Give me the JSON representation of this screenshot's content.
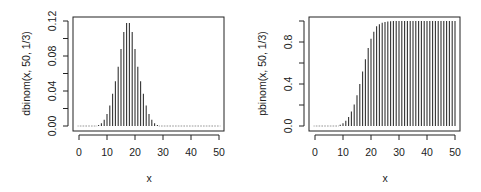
{
  "chart_data": [
    {
      "type": "bar",
      "style": "histogram-lines (type='h')",
      "title": "",
      "xlabel": "x",
      "ylabel": "dbinom(x, 50, 1/3)",
      "xlim": [
        0,
        50
      ],
      "ylim": [
        0,
        0.12
      ],
      "x_ticks": [
        "0",
        "10",
        "20",
        "30",
        "40",
        "50"
      ],
      "y_ticks": [
        "0.00",
        "0.04",
        "0.08",
        "0.12"
      ],
      "y_minor_ticks": [
        0.02,
        0.06,
        0.1
      ],
      "grid": false,
      "legend": null,
      "x": [
        0,
        1,
        2,
        3,
        4,
        5,
        6,
        7,
        8,
        9,
        10,
        11,
        12,
        13,
        14,
        15,
        16,
        17,
        18,
        19,
        20,
        21,
        22,
        23,
        24,
        25,
        26,
        27,
        28,
        29,
        30,
        31,
        32,
        33,
        34,
        35,
        36,
        37,
        38,
        39,
        40,
        41,
        42,
        43,
        44,
        45,
        46,
        47,
        48,
        49,
        50
      ],
      "values": [
        0.0,
        0.0,
        0.0,
        0.0,
        0.0,
        0.0001,
        0.0004,
        0.0011,
        0.0031,
        0.0071,
        0.0138,
        0.0233,
        0.0369,
        0.0512,
        0.0677,
        0.088,
        0.1074,
        0.1178,
        0.1178,
        0.1074,
        0.088,
        0.0677,
        0.0512,
        0.0369,
        0.0233,
        0.0138,
        0.0071,
        0.0031,
        0.0011,
        0.0004,
        0.0001,
        0.0,
        0.0,
        0.0,
        0.0,
        0.0,
        0.0,
        0.0,
        0.0,
        0.0,
        0.0,
        0.0,
        0.0,
        0.0,
        0.0,
        0.0,
        0.0,
        0.0,
        0.0,
        0.0,
        0.0
      ]
    },
    {
      "type": "bar",
      "style": "histogram-lines (type='h')",
      "title": "",
      "xlabel": "x",
      "ylabel": "pbinom(x, 50, 1/3)",
      "xlim": [
        0,
        50
      ],
      "ylim": [
        0,
        1
      ],
      "x_ticks": [
        "0",
        "10",
        "20",
        "30",
        "40",
        "50"
      ],
      "y_ticks": [
        "0.0",
        "0.4",
        "0.8"
      ],
      "y_minor_ticks": [
        0.2,
        0.6,
        1.0
      ],
      "grid": false,
      "legend": null,
      "x": [
        0,
        1,
        2,
        3,
        4,
        5,
        6,
        7,
        8,
        9,
        10,
        11,
        12,
        13,
        14,
        15,
        16,
        17,
        18,
        19,
        20,
        21,
        22,
        23,
        24,
        25,
        26,
        27,
        28,
        29,
        30,
        31,
        32,
        33,
        34,
        35,
        36,
        37,
        38,
        39,
        40,
        41,
        42,
        43,
        44,
        45,
        46,
        47,
        48,
        49,
        50
      ],
      "values": [
        0.0,
        0.0,
        0.0,
        0.0,
        0.0,
        0.0001,
        0.0005,
        0.0016,
        0.0047,
        0.0118,
        0.0256,
        0.0489,
        0.0858,
        0.137,
        0.2047,
        0.2927,
        0.4001,
        0.5179,
        0.6357,
        0.7431,
        0.8311,
        0.8988,
        0.95,
        0.97,
        0.983,
        0.991,
        0.996,
        0.9985,
        0.9994,
        0.9998,
        0.9999,
        1.0,
        1.0,
        1.0,
        1.0,
        1.0,
        1.0,
        1.0,
        1.0,
        1.0,
        1.0,
        1.0,
        1.0,
        1.0,
        1.0,
        1.0,
        1.0,
        1.0,
        1.0,
        1.0,
        1.0
      ]
    }
  ],
  "colors": {
    "line": "#333333",
    "axis": "#222222",
    "background": "#ffffff"
  }
}
